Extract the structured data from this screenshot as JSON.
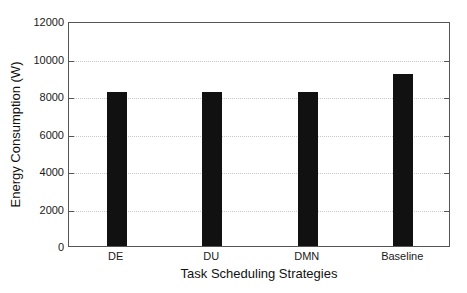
{
  "chart_data": {
    "type": "bar",
    "title": "",
    "categories": [
      "DE",
      "DU",
      "DMN",
      "Baseline"
    ],
    "values": [
      8200,
      8200,
      8200,
      9200
    ],
    "xlabel": "Task Scheduling Strategies",
    "ylabel": "Energy Consumption (W)",
    "ylim": [
      0,
      12000
    ],
    "yticks": [
      0,
      2000,
      4000,
      6000,
      8000,
      10000,
      12000
    ],
    "ytick_labels": [
      "0",
      "2000",
      "4000",
      "6000",
      "8000",
      "10000",
      "12000"
    ],
    "grid": true,
    "grid_axis": "y",
    "legend": null,
    "bar_color": "#111111",
    "grid_color": "#c8c8c8",
    "axis_color": "#555555",
    "background_color": "#ffffff"
  }
}
